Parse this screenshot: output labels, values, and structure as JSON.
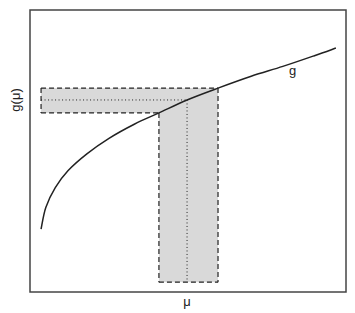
{
  "chart_data": {
    "type": "line",
    "title": "",
    "xlabel": "μ",
    "ylabel": "g(μ)",
    "xlim": [
      0,
      10
    ],
    "ylim": [
      0,
      10
    ],
    "grid": false,
    "ticks": false,
    "series": [
      {
        "name": "g",
        "x": [
          0.35,
          0.5,
          0.8,
          1.2,
          1.8,
          2.5,
          3.3,
          4.08,
          4.97,
          5.95,
          7.0,
          8.0,
          9.0,
          9.68
        ],
        "y": [
          2.23,
          3.0,
          3.7,
          4.3,
          4.9,
          5.45,
          5.95,
          6.35,
          6.81,
          7.23,
          7.65,
          8.0,
          8.38,
          8.65
        ]
      }
    ],
    "curve_label": "g",
    "curve_label_position": {
      "x": 8.2,
      "y": 7.7
    },
    "annotations": {
      "mu_center": 4.97,
      "mu_interval": [
        4.08,
        5.95
      ],
      "g_center": 6.81,
      "g_interval": [
        6.35,
        7.23
      ],
      "horizontal_band_x_start": 0.35,
      "vertical_band_y_start": 0.35,
      "band_fill": "#d9d9d9",
      "line_color": "#222222"
    }
  }
}
